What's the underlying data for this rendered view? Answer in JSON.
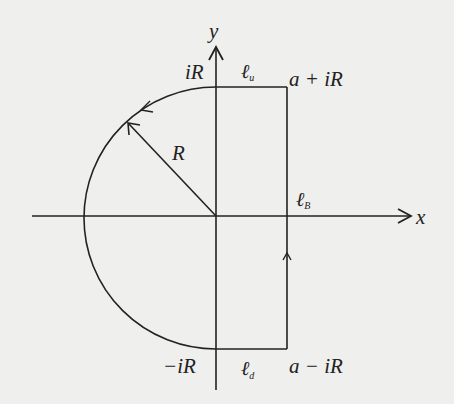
{
  "diagram": {
    "type": "contour-integration-path",
    "colors": {
      "background": "#efefed",
      "stroke": "#222222"
    },
    "axes": {
      "x_label": "x",
      "y_label": "y",
      "origin_px": [
        216,
        216
      ]
    },
    "radius_px": 132,
    "rect_right_x_px": 287,
    "labels": {
      "top_left": "iR",
      "top_right": "a + iR",
      "bottom_left": "−iR",
      "bottom_right": "a − iR",
      "radius": "R",
      "seg_up_main": "ℓ",
      "seg_up_sub": "u",
      "seg_down_main": "ℓ",
      "seg_down_sub": "d",
      "seg_right_main": "ℓ",
      "seg_right_sub": "B"
    },
    "edges": [
      {
        "name": "upper-segment",
        "from": "a + iR",
        "to": "iR",
        "label": "ℓ_u"
      },
      {
        "name": "left-semicircle",
        "from": "iR",
        "to": "-iR",
        "direction": "counterclockwise",
        "label": "arc radius R"
      },
      {
        "name": "lower-segment",
        "from": "-iR",
        "to": "a - iR",
        "label": "ℓ_d"
      },
      {
        "name": "right-segment",
        "from": "a - iR",
        "to": "a + iR",
        "direction": "upward",
        "label": "ℓ_B"
      }
    ]
  }
}
